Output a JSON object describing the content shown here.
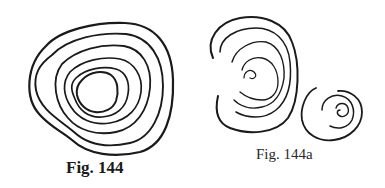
{
  "figures": [
    {
      "caption": "Fig. 144",
      "description": "Concentric irregular oval rings (six closed loops)",
      "ring_count": 6
    },
    {
      "caption": "Fig. 144a",
      "description": "Open nested arcs forming a spiral (left) and a small coiled spiral (right)"
    }
  ],
  "colors": {
    "stroke": "#1a1a1a",
    "background": "#ffffff"
  }
}
